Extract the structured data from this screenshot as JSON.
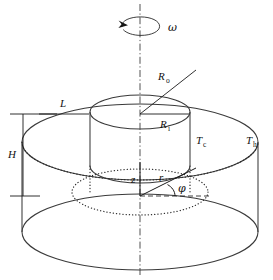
{
  "figure": {
    "background_color": "#ffffff",
    "line_color": "#3a3a3a",
    "label_color": "#111111"
  },
  "labels": {
    "omega": "ω",
    "outer_radius": "R",
    "outer_radius_sub": "o",
    "inner_radius": "R",
    "inner_radius_sub": "i",
    "gap_width": "L",
    "height": "H",
    "cold_temperature": "T",
    "cold_temperature_sub": "c",
    "hot_temperature": "T",
    "hot_temperature_sub": "h",
    "axial_coord": "z",
    "radial_coord": "r",
    "azimuthal_coord": "φ"
  },
  "annotations": {
    "rotation_arrow": "rotation-arrow",
    "axis_of_symmetry": "dash-dot-center-axis",
    "outer_radius_arrow": "arrow-to-outer-wall",
    "inner_radius_arrow": "arrow-to-inner-wall",
    "gap_dimension_arrow": "double-headed-horizontal",
    "height_dimension_arrow": "double-headed-vertical"
  },
  "geometry": {
    "center_x": 140,
    "top_plane_y": 104,
    "bottom_plane_y": 194,
    "outer_rx": 118,
    "outer_ry": 40,
    "inner_rx": 50,
    "inner_ry": 17,
    "height_px": 90
  }
}
